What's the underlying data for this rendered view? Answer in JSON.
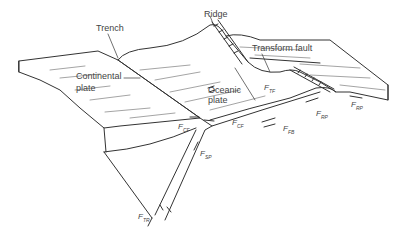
{
  "labels": {
    "trench": "Trench",
    "ridge": "Ridge",
    "transform_fault": "Transform fault",
    "continental_plate": "Continental\nplate",
    "continental_line1": "Continental",
    "continental_line2": "plate",
    "oceanic_line1": "Oceanic",
    "oceanic_line2": "plate"
  },
  "forces": [
    {
      "id": "tf",
      "main": "F",
      "sub": "TF"
    },
    {
      "id": "rp_left",
      "main": "F",
      "sub": "RP"
    },
    {
      "id": "rp_right",
      "main": "F",
      "sub": "RP"
    },
    {
      "id": "cf_left",
      "main": "F",
      "sub": "CF"
    },
    {
      "id": "cf_right",
      "main": "F",
      "sub": "CF"
    },
    {
      "id": "fb",
      "main": "F",
      "sub": "FB"
    },
    {
      "id": "sp",
      "main": "F",
      "sub": "SP"
    },
    {
      "id": "tr",
      "main": "F",
      "sub": "TR"
    }
  ],
  "colors": {
    "line": "#333333",
    "text": "#444444",
    "background": "#ffffff"
  }
}
